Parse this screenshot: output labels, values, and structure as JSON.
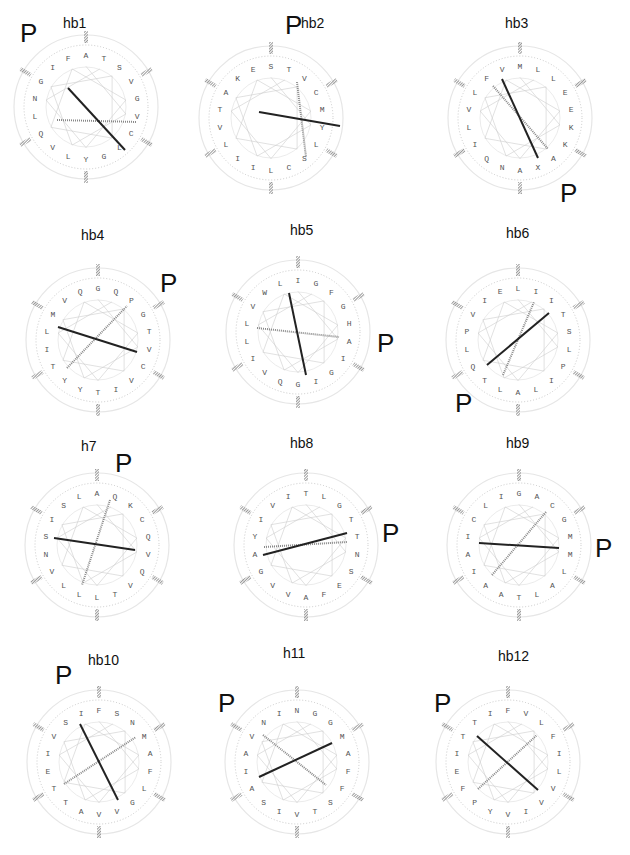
{
  "figure": {
    "marker_label": "P",
    "colors": {
      "axis_dark": "#222222",
      "axis_light": "#888888",
      "ring": "#bbbbbb",
      "connector": "#cccccc",
      "hatch": "#999999"
    }
  },
  "panels": [
    {
      "title": "hb1",
      "title_pos": [
        75,
        25
      ],
      "p_pos": [
        20,
        20
      ],
      "center": [
        86,
        107
      ],
      "residues": [
        "A",
        "T",
        "S",
        "V",
        "G",
        "V",
        "C",
        "L",
        "G",
        "Y",
        "L",
        "V",
        "Q",
        "L",
        "N",
        "G",
        "I",
        "F"
      ],
      "vec_dark": [
        [
          68,
          88
        ],
        [
          125,
          150
        ]
      ],
      "vec_hatch": [
        [
          57,
          120
        ],
        [
          137,
          122
        ]
      ]
    },
    {
      "title": "hb2",
      "title_pos": [
        103,
        25
      ],
      "p_pos": [
        75,
        12
      ],
      "center": [
        61,
        118
      ],
      "residues": [
        "S",
        "T",
        "V",
        "C",
        "M",
        "Y",
        "L",
        "S",
        "C",
        "L",
        "I",
        "I",
        "L",
        "V",
        "T",
        "A",
        "K",
        "E"
      ],
      "vec_dark": [
        [
          49,
          112
        ],
        [
          130,
          126
        ]
      ],
      "vec_hatch": [
        [
          87,
          82
        ],
        [
          96,
          157
        ]
      ]
    },
    {
      "title": "hb3",
      "title_pos": [
        97,
        25
      ],
      "p_pos": [
        140,
        180
      ],
      "center": [
        100,
        118
      ],
      "residues": [
        "M",
        "L",
        "L",
        "E",
        "E",
        "K",
        "K",
        "A",
        "X",
        "A",
        "N",
        "Q",
        "I",
        "L",
        "V",
        "L",
        "F",
        "V"
      ],
      "vec_dark": [
        [
          82,
          79
        ],
        [
          118,
          158
        ]
      ],
      "vec_hatch": [
        [
          73,
          86
        ],
        [
          128,
          149
        ]
      ]
    },
    {
      "title": "hb4",
      "title_pos": [
        93,
        27
      ],
      "p_pos": [
        160,
        60
      ],
      "center": [
        98,
        130
      ],
      "residues": [
        "G",
        "Q",
        "P",
        "G",
        "T",
        "V",
        "C",
        "V",
        "I",
        "T",
        "Y",
        "Y",
        "T",
        "I",
        "L",
        "M",
        "V",
        "Q"
      ],
      "vec_dark": [
        [
          58,
          117
        ],
        [
          137,
          142
        ]
      ],
      "vec_hatch": [
        [
          67,
          158
        ],
        [
          127,
          96
        ]
      ]
    },
    {
      "title": "hb5",
      "title_pos": [
        92,
        22
      ],
      "p_pos": [
        167,
        120
      ],
      "center": [
        88,
        122
      ],
      "residues": [
        "I",
        "G",
        "F",
        "G",
        "H",
        "A",
        "I",
        "G",
        "I",
        "G",
        "Q",
        "V",
        "I",
        "L",
        "L",
        "V",
        "W",
        "L"
      ],
      "vec_dark": [
        [
          79,
          83
        ],
        [
          96,
          165
        ]
      ],
      "vec_hatch": [
        [
          47,
          118
        ],
        [
          129,
          127
        ]
      ]
    },
    {
      "title": "hb6",
      "title_pos": [
        98,
        25
      ],
      "p_pos": [
        35,
        180
      ],
      "center": [
        98,
        130
      ],
      "residues": [
        "L",
        "I",
        "I",
        "T",
        "S",
        "L",
        "P",
        "I",
        "L",
        "A",
        "L",
        "T",
        "Q",
        "L",
        "P",
        "V",
        "I",
        "E"
      ],
      "vec_dark": [
        [
          67,
          155
        ],
        [
          129,
          103
        ]
      ],
      "vec_hatch": [
        [
          83,
          165
        ],
        [
          114,
          92
        ]
      ]
    },
    {
      "title": "h7",
      "title_pos": [
        93,
        28
      ],
      "p_pos": [
        115,
        30
      ],
      "center": [
        97,
        125
      ],
      "residues": [
        "A",
        "Q",
        "K",
        "C",
        "Q",
        "V",
        "Q",
        "V",
        "T",
        "L",
        "L",
        "L",
        "V",
        "N",
        "S",
        "I",
        "S",
        "L"
      ],
      "vec_dark": [
        [
          54,
          118
        ],
        [
          135,
          130
        ]
      ],
      "vec_hatch": [
        [
          110,
          80
        ],
        [
          82,
          165
        ]
      ]
    },
    {
      "title": "hb8",
      "title_pos": [
        92,
        25
      ],
      "p_pos": [
        172,
        100
      ],
      "center": [
        96,
        125
      ],
      "residues": [
        "T",
        "L",
        "G",
        "T",
        "T",
        "N",
        "S",
        "E",
        "F",
        "A",
        "V",
        "V",
        "G",
        "A",
        "Y",
        "I",
        "V",
        "I"
      ],
      "vec_dark": [
        [
          53,
          135
        ],
        [
          137,
          113
        ]
      ],
      "vec_hatch": [
        [
          54,
          127
        ],
        [
          137,
          122
        ]
      ]
    },
    {
      "title": "hb9",
      "title_pos": [
        98,
        25
      ],
      "p_pos": [
        175,
        115
      ],
      "center": [
        99,
        125
      ],
      "residues": [
        "G",
        "A",
        "C",
        "G",
        "M",
        "M",
        "L",
        "A",
        "L",
        "T",
        "A",
        "A",
        "I",
        "A",
        "I",
        "C",
        "L",
        "I"
      ],
      "vec_dark": [
        [
          59,
          123
        ],
        [
          139,
          128
        ]
      ],
      "vec_hatch": [
        [
          126,
          92
        ],
        [
          72,
          155
        ]
      ]
    },
    {
      "title": "hb10",
      "title_pos": [
        100,
        22
      ],
      "p_pos": [
        55,
        22
      ],
      "center": [
        99,
        122
      ],
      "residues": [
        "F",
        "S",
        "N",
        "M",
        "A",
        "F",
        "L",
        "G",
        "V",
        "V",
        "A",
        "T",
        "T",
        "E",
        "I",
        "V",
        "S",
        "I"
      ],
      "vec_dark": [
        [
          80,
          84
        ],
        [
          118,
          160
        ]
      ],
      "vec_hatch": [
        [
          64,
          144
        ],
        [
          136,
          97
        ]
      ]
    },
    {
      "title": "h11",
      "title_pos": [
        85,
        15
      ],
      "p_pos": [
        8,
        50
      ],
      "center": [
        87,
        122
      ],
      "residues": [
        "N",
        "G",
        "G",
        "M",
        "A",
        "F",
        "F",
        "S",
        "T",
        "V",
        "I",
        "S",
        "A",
        "I",
        "A",
        "V",
        "N",
        "I"
      ],
      "vec_dark": [
        [
          49,
          137
        ],
        [
          122,
          103
        ]
      ],
      "vec_hatch": [
        [
          53,
          95
        ],
        [
          116,
          145
        ]
      ]
    },
    {
      "title": "hb12",
      "title_pos": [
        90,
        18
      ],
      "p_pos": [
        14,
        50
      ],
      "center": [
        88,
        122
      ],
      "residues": [
        "F",
        "V",
        "L",
        "F",
        "I",
        "L",
        "V",
        "V",
        "I",
        "V",
        "Y",
        "P",
        "F",
        "E",
        "I",
        "T",
        "T",
        "I"
      ],
      "vec_dark": [
        [
          57,
          96
        ],
        [
          118,
          150
        ]
      ],
      "vec_hatch": [
        [
          58,
          149
        ],
        [
          117,
          95
        ]
      ]
    }
  ]
}
